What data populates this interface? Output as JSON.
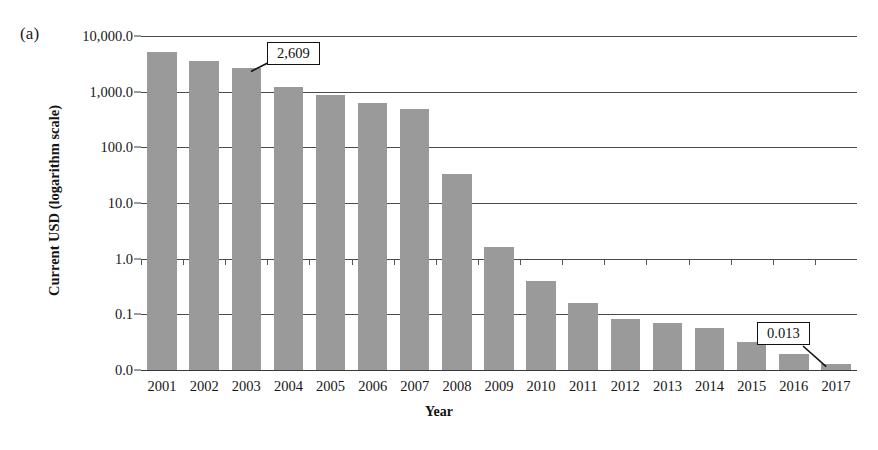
{
  "figure": {
    "panel_label": "(a)",
    "y_axis_title": "Current USD (logarithm scale)",
    "x_axis_title": "Year"
  },
  "chart_data": {
    "type": "bar",
    "title": "",
    "subtitle": "",
    "xlabel": "Year",
    "ylabel": "Current USD (logarithm scale)",
    "scale": "log10",
    "grid": true,
    "legend": "none",
    "ylim": [
      0.01,
      10000.0
    ],
    "ytick_labels": [
      "10,000.0",
      "1,000.0",
      "100.0",
      "10.0",
      "1.0",
      "0.1",
      "0.0"
    ],
    "ytick_values": [
      10000.0,
      1000.0,
      100.0,
      10.0,
      1.0,
      0.1,
      0.0
    ],
    "categories": [
      "2001",
      "2002",
      "2003",
      "2004",
      "2005",
      "2006",
      "2007",
      "2008",
      "2009",
      "2010",
      "2011",
      "2012",
      "2013",
      "2014",
      "2015",
      "2016",
      "2017"
    ],
    "values": [
      5200,
      3500,
      2609,
      1200,
      870,
      630,
      480,
      33,
      1.6,
      0.4,
      0.16,
      0.082,
      0.07,
      0.056,
      0.032,
      0.019,
      0.013
    ],
    "bar_color": "#9a9a9a",
    "annotations": [
      {
        "label": "2,609",
        "category": "2003",
        "value": 2609
      },
      {
        "label": "0.013",
        "category": "2017",
        "value": 0.013
      }
    ]
  }
}
